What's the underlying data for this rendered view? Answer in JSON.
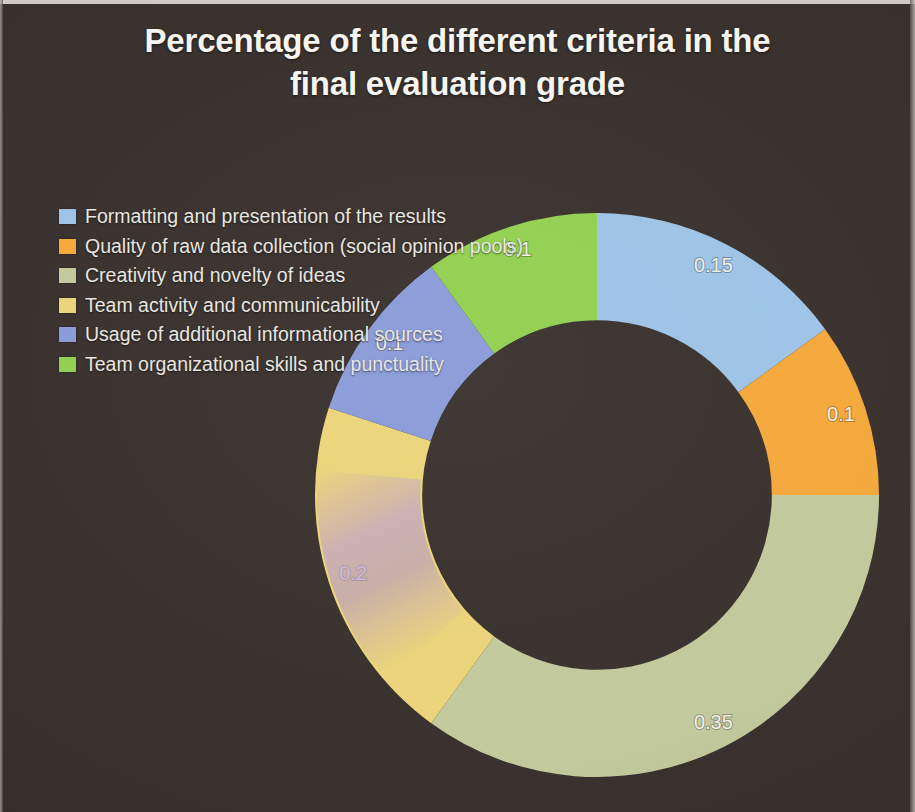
{
  "slide": {
    "background_color": "#3a322e",
    "title": "Percentage of the different criteria in the final evaluation grade",
    "title_line1": "Percentage of the different criteria in the",
    "title_line2": "final evaluation grade",
    "title_color": "#f7f5f2"
  },
  "legend": {
    "position": "left",
    "items": [
      {
        "label": "Formatting and presentation of the results",
        "color": "#9dc3e6"
      },
      {
        "label": "Quality of raw data collection (social opinion pools)",
        "color": "#f4a93c"
      },
      {
        "label": "Creativity and novelty of ideas",
        "color": "#c2c99c"
      },
      {
        "label": "Team activity and communicability",
        "color": "#ebd47a"
      },
      {
        "label": "Usage of additional informational sources",
        "color": "#8a9bd8"
      },
      {
        "label": "Team organizational skills and punctuality",
        "color": "#92d050"
      }
    ]
  },
  "chart_data": {
    "type": "pie",
    "variant": "doughnut",
    "title": "Percentage of the different criteria in the final evaluation grade",
    "xlabel": "",
    "ylabel": "",
    "legend_position": "left",
    "grid": false,
    "hole_ratio": 0.62,
    "start_angle_deg": 0,
    "direction": "clockwise",
    "total": 1.0,
    "value_format": "decimal",
    "categories": [
      "Formatting and presentation of the results",
      "Quality of raw data collection (social opinion pools)",
      "Creativity and novelty of ideas",
      "Team activity and communicability",
      "Usage of additional informational sources",
      "Team organizational skills and punctuality"
    ],
    "values": [
      0.15,
      0.1,
      0.35,
      0.2,
      0.1,
      0.1
    ],
    "data_labels": [
      "0.15",
      "0.1",
      "0.35",
      "0.2",
      "0.1",
      "0.1"
    ],
    "colors": [
      "#9dc3e6",
      "#f4a93c",
      "#c2c99c",
      "#ebd47a",
      "#8a9bd8",
      "#92d050"
    ],
    "slices": [
      {
        "label": "Formatting and presentation of the results",
        "value": 0.15,
        "data_label": "0.15",
        "color": "#9dc3e6"
      },
      {
        "label": "Quality of raw data collection (social opinion pools)",
        "value": 0.1,
        "data_label": "0.1",
        "color": "#f4a93c"
      },
      {
        "label": "Creativity and novelty of ideas",
        "value": 0.35,
        "data_label": "0.35",
        "color": "#c2c99c"
      },
      {
        "label": "Team activity and communicability",
        "value": 0.2,
        "data_label": "0.2",
        "color": "#ebd47a"
      },
      {
        "label": "Usage of additional informational sources",
        "value": 0.1,
        "data_label": "0.1",
        "color": "#8a9bd8"
      },
      {
        "label": "Team organizational skills and punctuality",
        "value": 0.1,
        "data_label": "0.1",
        "color": "#92d050"
      }
    ]
  }
}
